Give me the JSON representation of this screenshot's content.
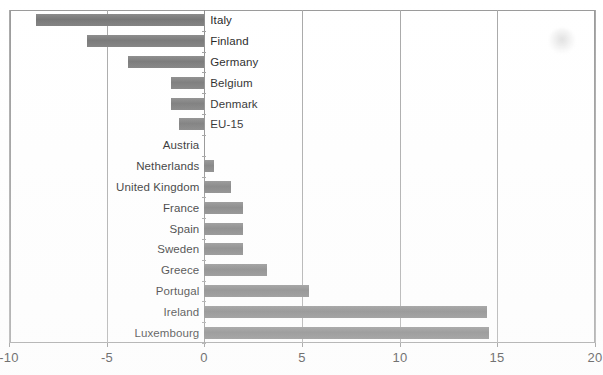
{
  "chart_data": {
    "type": "bar",
    "orientation": "horizontal",
    "title": "",
    "subtitle": "",
    "xlabel": "",
    "ylabel": "",
    "xlim": [
      -10,
      20
    ],
    "xticks": [
      -10,
      -5,
      0,
      5,
      10,
      15,
      20
    ],
    "xtick_labels": [
      "-10",
      "-5",
      "0",
      "5",
      "10",
      "15",
      "20"
    ],
    "grid": true,
    "grid_axis": "x",
    "legend": false,
    "legend_position": "none",
    "bar_color": "#7d7d7d",
    "categories": [
      "Italy",
      "Finland",
      "Germany",
      "Belgium",
      "Denmark",
      "EU-15",
      "Austria",
      "Netherlands",
      "United Kingdom",
      "France",
      "Spain",
      "Sweden",
      "Greece",
      "Portugal",
      "Ireland",
      "Luxembourg"
    ],
    "values": [
      -8.6,
      -6.0,
      -3.9,
      -1.7,
      -1.7,
      -1.3,
      0.0,
      0.5,
      1.4,
      2.0,
      2.0,
      2.0,
      3.2,
      5.4,
      14.5,
      14.6
    ]
  },
  "artifacts": {
    "scan_smudge": "faint-ink-smudge"
  }
}
